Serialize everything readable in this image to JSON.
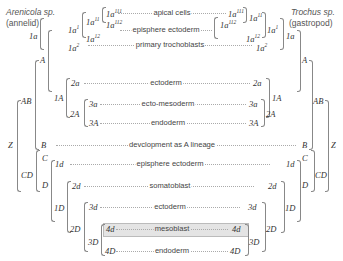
{
  "species": {
    "left": {
      "name": "Arenicola sp.",
      "group": "(annelid)"
    },
    "right": {
      "name": "Trochus sp.",
      "group": "(gastropod)"
    }
  },
  "fates": {
    "apical": "apical cells",
    "episphere1": "episphere ectoderm",
    "troch": "primary trochoblasts",
    "ecto": "ectoderm",
    "ectomeso": "ecto-mesoderm",
    "endo": "endoderm",
    "dev": "devclopment as A lineage",
    "episphere2": "episphere ectoderm",
    "somato": "somatoblast",
    "ecto2": "ectoderm",
    "meso": "mesoblast",
    "endo2": "endoderm"
  },
  "labels": {
    "Z": "Z",
    "AB": "AB",
    "CD": "CD",
    "A": "A",
    "B": "B",
    "C": "C",
    "D": "D",
    "1a": "1a",
    "1A": "1A",
    "2A": "2A",
    "2a": "2a",
    "3a": "3a",
    "3A": "3A",
    "1d": "1d",
    "1D": "1D",
    "2d": "2d",
    "2D": "2D",
    "3d": "3d",
    "3D": "3D",
    "4d": "4d",
    "4D": "4D",
    "1a1_base": "1a",
    "1a1_sup": "1",
    "1a2_base": "1a",
    "1a2_sup": "2",
    "1a11_base": "1a",
    "1a11_sup": "11",
    "1a12_base": "1a",
    "1a12_sup": "12",
    "1a111_base": "1a",
    "1a111_sup": "111",
    "1a112_base": "1a",
    "1a112_sup": "112"
  },
  "highlight": {
    "lineage": "4d",
    "color": "#e4e4e4"
  }
}
